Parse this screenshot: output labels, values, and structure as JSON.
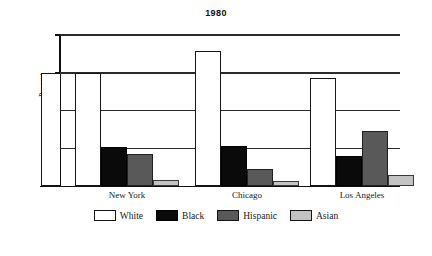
{
  "chart_data": {
    "type": "bar",
    "title": "1980",
    "xlabel": "",
    "ylabel": "Percent",
    "categories": [
      "New York",
      "Chicago",
      "Los Angeles"
    ],
    "series": [
      {
        "name": "White",
        "color": "#ffffff",
        "values": [
          60.0,
          71.5,
          57.0
        ]
      },
      {
        "name": "Black",
        "color": "#0a0a0a",
        "values": [
          20.5,
          21.0,
          16.0
        ]
      },
      {
        "name": "Hispanic",
        "color": "#595959",
        "values": [
          17.0,
          9.0,
          29.0
        ]
      },
      {
        "name": "Asian",
        "color": "#c3c3c3",
        "values": [
          3.0,
          2.5,
          6.0
        ]
      }
    ],
    "ylim": [
      0,
      80
    ],
    "yticks": [
      0,
      20,
      40,
      60,
      80
    ],
    "ytick_labels": [
      "0",
      "20",
      "40",
      "60",
      "80"
    ],
    "grid": "horizontal",
    "legend_position": "bottom"
  },
  "legend": {
    "items": [
      {
        "label": "White"
      },
      {
        "label": "Black"
      },
      {
        "label": "Hispanic"
      },
      {
        "label": "Asian"
      }
    ]
  },
  "axis": {
    "y_label": "Percent",
    "ticks": [
      {
        "label": "80"
      },
      {
        "label": "60"
      },
      {
        "label": "40"
      },
      {
        "label": "20"
      },
      {
        "label": "0"
      }
    ]
  }
}
